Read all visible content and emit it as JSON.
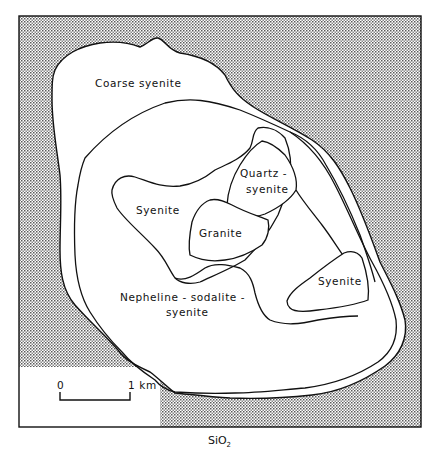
{
  "figure": {
    "type": "geologic-map",
    "caption": "SiO",
    "caption_subscript": "2",
    "colors": {
      "background": "#ffffff",
      "stipple": "#6a6a6a",
      "outline": "#111111"
    }
  },
  "units": [
    {
      "id": "coarse-syenite",
      "label": "Coarse syenite"
    },
    {
      "id": "syenite-west",
      "label": "Syenite"
    },
    {
      "id": "quartz-syenite",
      "label_line1": "Quartz -",
      "label_line2": "syenite"
    },
    {
      "id": "granite",
      "label": "Granite"
    },
    {
      "id": "syenite-east",
      "label": "Syenite"
    },
    {
      "id": "nepheline-sodalite-syenite",
      "label_line1": "Nepheline - sodalite -",
      "label_line2": "syenite"
    }
  ],
  "scale_bar": {
    "start_label": "0",
    "end_label": "1 km"
  }
}
